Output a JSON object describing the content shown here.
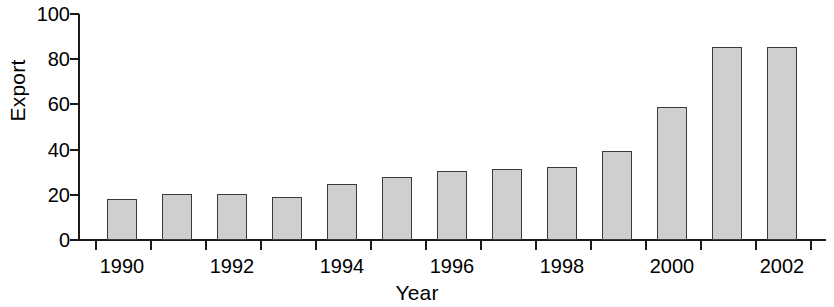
{
  "chart_data": {
    "type": "bar",
    "title": "",
    "subtitle": "",
    "xlabel": "Year",
    "ylabel": "Export",
    "categories": [
      "1990",
      "1991",
      "1992",
      "1993",
      "1994",
      "1995",
      "1996",
      "1997",
      "1998",
      "1999",
      "2000",
      "2001",
      "2002"
    ],
    "values": [
      18,
      20.5,
      20.5,
      19,
      25,
      28,
      30.5,
      31.5,
      32.5,
      39.5,
      59,
      85.5,
      85.5
    ],
    "series": [
      {
        "name": "Export",
        "values": [
          18,
          20.5,
          20.5,
          19,
          25,
          28,
          30.5,
          31.5,
          32.5,
          39.5,
          59,
          85.5,
          85.5
        ]
      }
    ],
    "ylim": [
      0,
      100
    ],
    "y_ticks": [
      0,
      20,
      40,
      60,
      80,
      100
    ],
    "y_tick_labels": [
      "0",
      "20",
      "40",
      "60",
      "80",
      "100"
    ],
    "x_tick_labels": [
      "1990",
      "1992",
      "1994",
      "1996",
      "1998",
      "2000",
      "2002"
    ],
    "x_tick_label_indices": [
      0,
      2,
      4,
      6,
      8,
      10,
      12
    ],
    "grid": false,
    "legend": false,
    "legend_position": "none",
    "bar_fill_color": "#cfcfcf",
    "bar_edge_color": "#3a3a3a",
    "axis_color": "#1a1a1a",
    "background_color": "#ffffff",
    "annotations": []
  }
}
